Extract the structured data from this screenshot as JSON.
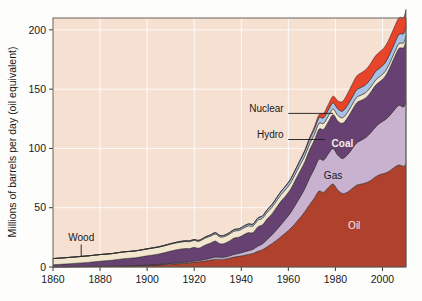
{
  "chart_data": {
    "type": "area",
    "title": "",
    "xlabel": "",
    "ylabel": "Millions of barrels per day (oil equivalent)",
    "xlim": [
      1860,
      2010
    ],
    "ylim": [
      0,
      210
    ],
    "xticks": [
      1860,
      1880,
      1900,
      1920,
      1940,
      1960,
      1980,
      2000
    ],
    "yticks": [
      0,
      50,
      100,
      150,
      200
    ],
    "grid": true,
    "legend_position": "inline-annotations",
    "stacked": true,
    "stack_order_bottom_to_top": [
      "Oil",
      "Gas",
      "Coal",
      "Wood",
      "Hydro",
      "Nuclear"
    ],
    "x": [
      1860,
      1865,
      1870,
      1875,
      1880,
      1885,
      1890,
      1895,
      1900,
      1905,
      1910,
      1913,
      1916,
      1918,
      1920,
      1922,
      1925,
      1927,
      1929,
      1931,
      1933,
      1935,
      1937,
      1939,
      1941,
      1943,
      1945,
      1947,
      1949,
      1951,
      1953,
      1955,
      1957,
      1959,
      1961,
      1963,
      1965,
      1967,
      1969,
      1971,
      1973,
      1975,
      1977,
      1979,
      1981,
      1983,
      1985,
      1987,
      1989,
      1991,
      1993,
      1995,
      1997,
      1999,
      2001,
      2003,
      2005,
      2007,
      2009,
      2010
    ],
    "series": [
      {
        "name": "Oil",
        "color": "#b0412c",
        "values": [
          0.1,
          0.2,
          0.3,
          0.4,
          0.5,
          0.6,
          0.8,
          1.0,
          1.3,
          1.8,
          2.4,
          2.8,
          3.2,
          3.6,
          4.0,
          4.4,
          5.2,
          5.8,
          6.6,
          6.4,
          6.6,
          7.4,
          8.4,
          9.0,
          9.8,
          10.6,
          11.4,
          13.2,
          14.6,
          17.0,
          19.6,
          22.6,
          25.8,
          29.0,
          32.6,
          37.0,
          41.6,
          46.6,
          52.6,
          58.0,
          64.0,
          63.0,
          67.0,
          70.0,
          65.0,
          62.0,
          63.0,
          66.0,
          69.0,
          70.0,
          71.0,
          73.0,
          76.0,
          78.0,
          79.0,
          81.0,
          84.0,
          86.0,
          85.0,
          87.0
        ]
      },
      {
        "name": "Gas",
        "color": "#c8b2cf",
        "values": [
          0.0,
          0.0,
          0.0,
          0.0,
          0.1,
          0.1,
          0.2,
          0.2,
          0.3,
          0.4,
          0.6,
          0.7,
          0.8,
          0.9,
          1.0,
          1.1,
          1.4,
          1.6,
          1.9,
          1.8,
          1.8,
          2.0,
          2.3,
          2.5,
          2.8,
          3.2,
          3.6,
          4.4,
          5.0,
          6.2,
          7.4,
          8.8,
          10.2,
          11.8,
          13.4,
          15.4,
          17.4,
          19.6,
          22.4,
          24.8,
          27.0,
          27.2,
          28.6,
          30.0,
          29.4,
          29.6,
          31.4,
          33.4,
          35.6,
          37.0,
          38.4,
          40.2,
          42.0,
          43.6,
          45.0,
          46.6,
          48.4,
          50.4,
          50.0,
          52.5
        ]
      },
      {
        "name": "Coal",
        "color": "#674171",
        "values": [
          1.8,
          2.3,
          2.9,
          3.5,
          4.3,
          5.0,
          6.0,
          6.6,
          7.8,
          8.8,
          10.4,
          11.2,
          11.6,
          11.0,
          11.6,
          10.4,
          12.2,
          12.8,
          13.4,
          11.4,
          11.6,
          12.6,
          13.8,
          13.6,
          14.6,
          15.2,
          14.0,
          16.2,
          16.0,
          17.4,
          17.8,
          19.0,
          19.8,
          19.6,
          19.8,
          21.0,
          22.0,
          22.6,
          23.6,
          24.0,
          25.2,
          26.0,
          27.0,
          28.4,
          28.8,
          29.6,
          31.0,
          32.6,
          33.8,
          33.6,
          33.4,
          34.2,
          35.2,
          35.0,
          36.4,
          40.0,
          44.0,
          48.0,
          50.0,
          52.0
        ]
      },
      {
        "name": "Wood",
        "color": "#f2e6cf",
        "values": [
          5.2,
          5.3,
          5.4,
          5.5,
          5.6,
          5.6,
          5.7,
          5.7,
          5.8,
          5.8,
          5.9,
          5.9,
          5.9,
          5.9,
          5.9,
          5.9,
          5.9,
          5.9,
          5.9,
          5.8,
          5.8,
          5.8,
          5.8,
          5.7,
          5.7,
          5.7,
          5.6,
          5.6,
          5.6,
          5.5,
          5.5,
          5.4,
          5.4,
          5.3,
          5.3,
          5.2,
          5.2,
          5.1,
          5.1,
          5.0,
          5.0,
          4.9,
          4.9,
          4.8,
          4.8,
          4.7,
          4.7,
          4.6,
          4.6,
          4.5,
          4.5,
          4.4,
          4.4,
          4.3,
          4.3,
          4.2,
          4.2,
          4.1,
          4.1,
          4.0
        ]
      },
      {
        "name": "Hydro",
        "color": "#a8c1e4",
        "values": [
          0.0,
          0.0,
          0.0,
          0.0,
          0.0,
          0.0,
          0.1,
          0.1,
          0.2,
          0.3,
          0.4,
          0.5,
          0.6,
          0.6,
          0.7,
          0.7,
          0.9,
          1.0,
          1.1,
          1.1,
          1.1,
          1.2,
          1.3,
          1.4,
          1.5,
          1.6,
          1.6,
          1.8,
          1.9,
          2.1,
          2.3,
          2.5,
          2.7,
          2.9,
          3.1,
          3.3,
          3.6,
          3.8,
          4.1,
          4.3,
          4.6,
          4.8,
          5.0,
          5.2,
          5.4,
          5.6,
          5.9,
          6.1,
          6.3,
          6.5,
          6.7,
          6.9,
          7.1,
          7.2,
          7.2,
          7.3,
          7.5,
          7.7,
          7.9,
          8.1
        ]
      },
      {
        "name": "Nuclear",
        "color": "#e8442a",
        "values": [
          0.0,
          0.0,
          0.0,
          0.0,
          0.0,
          0.0,
          0.0,
          0.0,
          0.0,
          0.0,
          0.0,
          0.0,
          0.0,
          0.0,
          0.0,
          0.0,
          0.0,
          0.0,
          0.0,
          0.0,
          0.0,
          0.0,
          0.0,
          0.0,
          0.0,
          0.0,
          0.0,
          0.0,
          0.0,
          0.0,
          0.0,
          0.0,
          0.1,
          0.1,
          0.2,
          0.3,
          0.5,
          0.8,
          1.2,
          1.8,
          2.6,
          3.6,
          4.6,
          5.6,
          6.8,
          8.0,
          9.6,
          10.8,
          11.6,
          12.2,
          12.6,
          13.0,
          13.2,
          13.6,
          13.8,
          13.8,
          14.0,
          14.0,
          13.6,
          13.6
        ]
      }
    ],
    "annotations": [
      {
        "text": "Wood",
        "style": "dark",
        "kind": "leader-down"
      },
      {
        "text": "Nuclear",
        "style": "dark",
        "kind": "leader-right"
      },
      {
        "text": "Hydro",
        "style": "dark",
        "kind": "leader-right"
      },
      {
        "text": "Coal",
        "style": "light-bold",
        "kind": "inline"
      },
      {
        "text": "Gas",
        "style": "dark",
        "kind": "inline"
      },
      {
        "text": "Oil",
        "style": "light",
        "kind": "inline"
      }
    ],
    "colors": {
      "plot_background": "#f6e0d2",
      "figure_background": "#fdfdfb",
      "gridline": "#ffffff",
      "frame": "#6a6258",
      "text": "#1a1a1a"
    }
  }
}
